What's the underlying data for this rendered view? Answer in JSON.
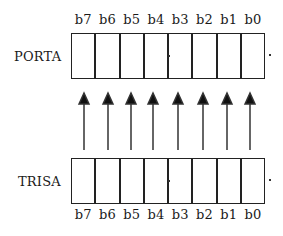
{
  "diagram": {
    "registers": [
      {
        "name": "PORTA",
        "bits": [
          "b7",
          "b6",
          "b5",
          "b4",
          "b3",
          "b2",
          "b1",
          "b0"
        ]
      },
      {
        "name": "TRISA",
        "bits": [
          "b7",
          "b6",
          "b5",
          "b4",
          "b3",
          "b2",
          "b1",
          "b0"
        ]
      }
    ],
    "arrow_direction": "TRISA to PORTA (upward)",
    "arrow_count": 8,
    "colors": {
      "line": "#222222",
      "background": "#ffffff"
    }
  }
}
